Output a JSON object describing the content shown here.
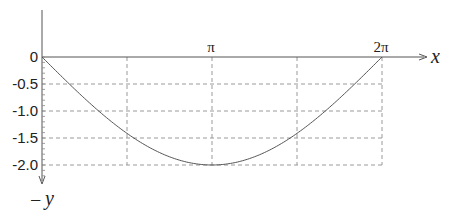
{
  "chart_data": {
    "type": "line",
    "title": "",
    "xlabel": "x",
    "ylabel": "y",
    "ylabel_prefix": "−",
    "x_ticks": [
      {
        "value": 0,
        "label": ""
      },
      {
        "value": 1.5708,
        "label": ""
      },
      {
        "value": 3.1416,
        "label": "π"
      },
      {
        "value": 4.7124,
        "label": ""
      },
      {
        "value": 6.2832,
        "label": "2π"
      }
    ],
    "y_ticks": [
      {
        "value": 0,
        "label": "0"
      },
      {
        "value": -0.5,
        "label": "-0.5"
      },
      {
        "value": -1.0,
        "label": "-1.0"
      },
      {
        "value": -1.5,
        "label": "-1.5"
      },
      {
        "value": -2.0,
        "label": "-2.0"
      }
    ],
    "xlim": [
      0,
      6.2832
    ],
    "ylim": [
      -2.0,
      0
    ],
    "grid": true,
    "grid_style": "dashed",
    "legend": null,
    "series": [
      {
        "name": "curve",
        "function": "y = -2·sin(x/2)",
        "x": [
          0,
          0.3927,
          0.7854,
          1.1781,
          1.5708,
          1.9635,
          2.3562,
          2.7489,
          3.1416,
          3.5343,
          3.927,
          4.3197,
          4.7124,
          5.1051,
          5.4978,
          5.8905,
          6.2832
        ],
        "y": [
          0,
          -0.39,
          -0.77,
          -1.11,
          -1.41,
          -1.66,
          -1.85,
          -1.96,
          -2.0,
          -1.96,
          -1.85,
          -1.66,
          -1.41,
          -1.11,
          -0.77,
          -0.39,
          0
        ]
      }
    ],
    "colors": {
      "curve": "#555555",
      "axis": "#555555",
      "grid": "#9a9a9a",
      "text": "#222222"
    }
  }
}
